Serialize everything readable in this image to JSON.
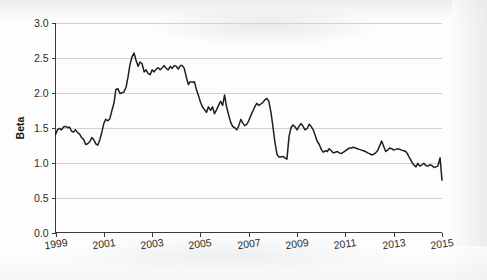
{
  "figure": {
    "background_color": "#fdfdfd",
    "line_color": "#1f1f22",
    "grid_color": "#d2d2d4",
    "axis_color": "#3a3a3a"
  },
  "chart_data": {
    "type": "line",
    "title": "",
    "subtitle": "",
    "xlabel": "",
    "ylabel": "Beta",
    "xlim": [
      1999.0,
      2015.0
    ],
    "ylim": [
      0.0,
      3.0
    ],
    "grid": "horizontal",
    "legend": "none",
    "annotations": [],
    "x_tick_labels": [
      "1999",
      "2001",
      "2003",
      "2005",
      "2007",
      "2009",
      "2011",
      "2013",
      "2015"
    ],
    "x_tick_values": [
      1999,
      2001,
      2003,
      2005,
      2007,
      2009,
      2011,
      2013,
      2015
    ],
    "y_tick_labels": [
      "0.0",
      "0.5",
      "1.0",
      "1.5",
      "2.0",
      "2.5",
      "3.0"
    ],
    "y_tick_values": [
      0.0,
      0.5,
      1.0,
      1.5,
      2.0,
      2.5,
      3.0
    ],
    "series": [
      {
        "name": "Beta",
        "x": [
          1999.0,
          1999.08,
          1999.17,
          1999.25,
          1999.33,
          1999.42,
          1999.5,
          1999.58,
          1999.67,
          1999.75,
          1999.83,
          1999.92,
          2000.0,
          2000.08,
          2000.17,
          2000.25,
          2000.33,
          2000.42,
          2000.5,
          2000.58,
          2000.67,
          2000.75,
          2000.83,
          2000.92,
          2001.0,
          2001.08,
          2001.17,
          2001.25,
          2001.33,
          2001.42,
          2001.5,
          2001.58,
          2001.67,
          2001.75,
          2001.83,
          2001.92,
          2002.0,
          2002.08,
          2002.17,
          2002.25,
          2002.33,
          2002.42,
          2002.5,
          2002.58,
          2002.67,
          2002.75,
          2002.83,
          2002.92,
          2003.0,
          2003.08,
          2003.17,
          2003.25,
          2003.33,
          2003.42,
          2003.5,
          2003.58,
          2003.67,
          2003.75,
          2003.83,
          2003.92,
          2004.0,
          2004.08,
          2004.17,
          2004.25,
          2004.33,
          2004.42,
          2004.5,
          2004.58,
          2004.67,
          2004.75,
          2004.83,
          2004.92,
          2005.0,
          2005.08,
          2005.17,
          2005.25,
          2005.33,
          2005.42,
          2005.5,
          2005.58,
          2005.67,
          2005.75,
          2005.83,
          2005.92,
          2006.0,
          2006.08,
          2006.17,
          2006.25,
          2006.33,
          2006.42,
          2006.5,
          2006.58,
          2006.67,
          2006.75,
          2006.83,
          2006.92,
          2007.0,
          2007.08,
          2007.17,
          2007.25,
          2007.33,
          2007.42,
          2007.5,
          2007.58,
          2007.67,
          2007.75,
          2007.83,
          2007.92,
          2008.0,
          2008.08,
          2008.17,
          2008.25,
          2008.33,
          2008.42,
          2008.5,
          2008.58,
          2008.67,
          2008.75,
          2008.83,
          2008.92,
          2009.0,
          2009.08,
          2009.17,
          2009.25,
          2009.33,
          2009.42,
          2009.5,
          2009.58,
          2009.67,
          2009.75,
          2009.83,
          2009.92,
          2010.0,
          2010.08,
          2010.17,
          2010.25,
          2010.33,
          2010.42,
          2010.5,
          2010.58,
          2010.67,
          2010.75,
          2010.83,
          2010.92,
          2011.0,
          2011.08,
          2011.17,
          2011.25,
          2011.33,
          2011.42,
          2011.5,
          2011.58,
          2011.67,
          2011.75,
          2011.83,
          2011.92,
          2012.0,
          2012.08,
          2012.17,
          2012.25,
          2012.33,
          2012.42,
          2012.5,
          2012.58,
          2012.67,
          2012.75,
          2012.83,
          2012.92,
          2013.0,
          2013.08,
          2013.17,
          2013.25,
          2013.33,
          2013.42,
          2013.5,
          2013.58,
          2013.67,
          2013.75,
          2013.83,
          2013.92,
          2014.0,
          2014.08,
          2014.17,
          2014.25,
          2014.33,
          2014.42,
          2014.5,
          2014.58,
          2014.67,
          2014.75,
          2014.83,
          2014.92,
          2015.0
        ],
        "values": [
          1.4,
          1.47,
          1.49,
          1.47,
          1.51,
          1.52,
          1.5,
          1.51,
          1.45,
          1.44,
          1.47,
          1.43,
          1.41,
          1.36,
          1.33,
          1.26,
          1.27,
          1.3,
          1.36,
          1.33,
          1.27,
          1.25,
          1.32,
          1.44,
          1.56,
          1.62,
          1.6,
          1.63,
          1.74,
          1.85,
          2.05,
          2.06,
          1.99,
          2.0,
          2.01,
          2.08,
          2.22,
          2.4,
          2.52,
          2.57,
          2.47,
          2.38,
          2.44,
          2.42,
          2.3,
          2.33,
          2.28,
          2.26,
          2.33,
          2.3,
          2.34,
          2.36,
          2.33,
          2.36,
          2.39,
          2.35,
          2.33,
          2.38,
          2.35,
          2.39,
          2.38,
          2.34,
          2.39,
          2.39,
          2.35,
          2.22,
          2.12,
          2.16,
          2.15,
          2.16,
          2.05,
          1.96,
          1.87,
          1.8,
          1.76,
          1.72,
          1.8,
          1.75,
          1.8,
          1.7,
          1.76,
          1.82,
          1.88,
          1.82,
          1.97,
          1.8,
          1.68,
          1.58,
          1.52,
          1.5,
          1.47,
          1.52,
          1.62,
          1.57,
          1.53,
          1.55,
          1.6,
          1.67,
          1.74,
          1.8,
          1.85,
          1.82,
          1.84,
          1.86,
          1.9,
          1.92,
          1.88,
          1.72,
          1.52,
          1.3,
          1.12,
          1.08,
          1.08,
          1.09,
          1.07,
          1.05,
          1.38,
          1.5,
          1.54,
          1.51,
          1.47,
          1.52,
          1.56,
          1.52,
          1.47,
          1.49,
          1.55,
          1.52,
          1.47,
          1.39,
          1.31,
          1.26,
          1.19,
          1.15,
          1.17,
          1.16,
          1.2,
          1.17,
          1.14,
          1.15,
          1.16,
          1.14,
          1.13,
          1.15,
          1.17,
          1.19,
          1.21,
          1.21,
          1.22,
          1.21,
          1.2,
          1.19,
          1.18,
          1.17,
          1.16,
          1.14,
          1.13,
          1.11,
          1.12,
          1.14,
          1.17,
          1.24,
          1.31,
          1.24,
          1.16,
          1.18,
          1.21,
          1.2,
          1.18,
          1.19,
          1.2,
          1.19,
          1.18,
          1.17,
          1.16,
          1.12,
          1.06,
          1.01,
          0.97,
          0.94,
          0.99,
          0.95,
          0.97,
          0.99,
          0.96,
          0.95,
          0.97,
          0.96,
          0.93,
          0.94,
          0.95,
          1.07,
          0.75
        ]
      }
    ]
  }
}
